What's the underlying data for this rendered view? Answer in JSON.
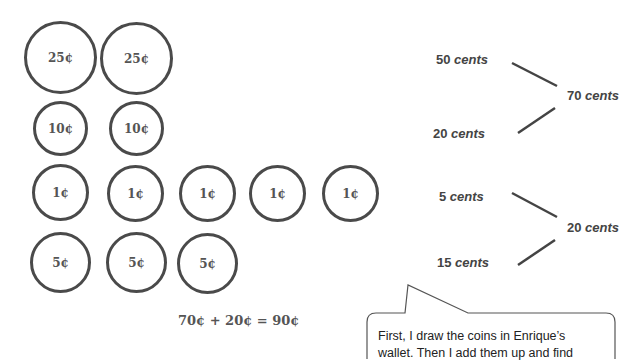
{
  "coins": {
    "row1": [
      "25¢",
      "25¢"
    ],
    "row2": [
      "10¢",
      "10¢"
    ],
    "row3": [
      "1¢",
      "1¢",
      "1¢",
      "1¢",
      "1¢"
    ],
    "row4": [
      "5¢",
      "5¢",
      "5¢"
    ]
  },
  "equation": "70¢ + 20¢ = 90¢",
  "number_bonds": [
    {
      "part1_num": "50",
      "part2_num": "20",
      "whole_num": "70",
      "unit": "cents"
    },
    {
      "part1_num": "5",
      "part2_num": "15",
      "whole_num": "20",
      "unit": "cents"
    }
  ],
  "callout": {
    "line1": "First, I draw the coins in Enrique’s",
    "line2": "wallet.  Then I add them up and find"
  }
}
